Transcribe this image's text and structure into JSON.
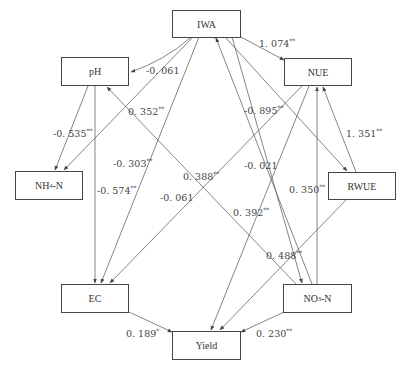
{
  "nodes": {
    "iwa": {
      "label": "IWA"
    },
    "ph": {
      "label": "pH"
    },
    "nue": {
      "label": "NUE"
    },
    "nh4n": {
      "label": "NH",
      "sub": "4",
      "suffix": "-N"
    },
    "rwue": {
      "label": "RWUE"
    },
    "ec": {
      "label": "EC"
    },
    "no3n": {
      "label": "NO",
      "sub": "3",
      "suffix": "-N"
    },
    "yield": {
      "label": "Yield"
    }
  },
  "paths": [
    {
      "id": "iwa-nue",
      "from": "IWA",
      "to": "NUE",
      "coef": "1. 074",
      "sig": "**"
    },
    {
      "id": "iwa-ph",
      "from": "IWA",
      "to": "pH",
      "coef": "-0. 061",
      "sig": ""
    },
    {
      "id": "ph-nh4",
      "from": "pH",
      "to": "NH4-N",
      "coef": "-0. 535",
      "sig": "**"
    },
    {
      "id": "no3-ph",
      "from": "NO3-N",
      "to": "pH",
      "coef": "0. 352",
      "sig": "**"
    },
    {
      "id": "ph-ec",
      "from": "pH",
      "to": "EC",
      "coef": "-0. 574",
      "sig": "**"
    },
    {
      "id": "iwa-ec",
      "from": "IWA",
      "to": "EC",
      "coef": "-0. 303",
      "sig": "**"
    },
    {
      "id": "iwa-nh4",
      "from": "IWA",
      "to": "NH4-N",
      "coef": "0. 388",
      "sig": "**"
    },
    {
      "id": "nue-ec",
      "from": "NUE",
      "to": "EC",
      "coef": "-0. 061",
      "sig": ""
    },
    {
      "id": "yield-iwa",
      "from": "Yield",
      "to": "IWA",
      "coef": "-0. 895",
      "sig": "**"
    },
    {
      "id": "no3-iwa",
      "from": "NO3-N",
      "to": "IWA",
      "coef": "-0. 021",
      "sig": ""
    },
    {
      "id": "iwa-rwue",
      "from": "IWA",
      "to": "RWUE",
      "coef": "",
      "sig": ""
    },
    {
      "id": "rwue-nue",
      "from": "RWUE",
      "to": "NUE",
      "coef": "1. 351",
      "sig": "**"
    },
    {
      "id": "no3-nue",
      "from": "NO3-N",
      "to": "NUE",
      "coef": "0. 350",
      "sig": "**"
    },
    {
      "id": "nue-yield",
      "from": "NUE",
      "to": "Yield",
      "coef": "0. 392",
      "sig": "**"
    },
    {
      "id": "rwue-yield",
      "from": "RWUE",
      "to": "Yield",
      "coef": "0. 488",
      "sig": "**"
    },
    {
      "id": "ec-yield",
      "from": "EC",
      "to": "Yield",
      "coef": "0. 189",
      "sig": "*"
    },
    {
      "id": "no3-yield",
      "from": "NO3-N",
      "to": "Yield",
      "coef": "0. 230",
      "sig": "**"
    }
  ],
  "labels": {
    "l1074": "1. 074",
    "l1074s": "**",
    "l061a": "-0. 061",
    "l352": "0. 352",
    "l352s": "**",
    "l535": "-0. 535",
    "l535s": "**",
    "l303": "-0. 303",
    "l303s": "**",
    "l574": "-0. 574",
    "l574s": "**",
    "l388": "0. 388",
    "l388s": "**",
    "l061b": "-0. 061",
    "l895": "-0. 895",
    "l895s": "**",
    "l021": "-0. 021",
    "l1351": "1. 351",
    "l1351s": "**",
    "l350": "0. 350",
    "l350s": "**",
    "l392": "0. 392",
    "l392s": "**",
    "l488": "0. 488",
    "l488s": "**",
    "l189": "0. 189",
    "l189s": "*",
    "l230": "0. 230",
    "l230s": "**"
  },
  "colors": {
    "line": "#555555",
    "text": "#333333",
    "box_border": "#444444"
  }
}
